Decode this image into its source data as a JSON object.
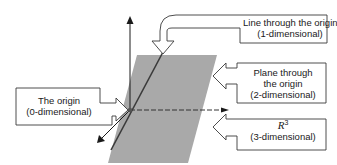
{
  "diagram": {
    "type": "subspaces-of-R3",
    "colors": {
      "plane_fill": "#a9a9a9",
      "axis": "#1a1a1a",
      "line": "#3a3a3a",
      "callout_stroke": "#3a3a3a",
      "callout_fill": "#ffffff",
      "background": "#ffffff"
    },
    "axes": {
      "vertical": "z-axis arrow up",
      "horizontal": "dashed x-axis arrow right",
      "diagonal": "y-axis arrow toward lower-left"
    },
    "callouts": {
      "line": {
        "line1": "Line through the origin",
        "line2": "(1-dimensional)"
      },
      "plane": {
        "line1": "Plane through",
        "line2": "the origin",
        "line3": "(2-dimensional)"
      },
      "space": {
        "symbol": "R",
        "exponent": "3",
        "line2": "(3-dimensional)"
      },
      "origin": {
        "line1": "The origin",
        "line2": "(0-dimensional)"
      }
    }
  }
}
